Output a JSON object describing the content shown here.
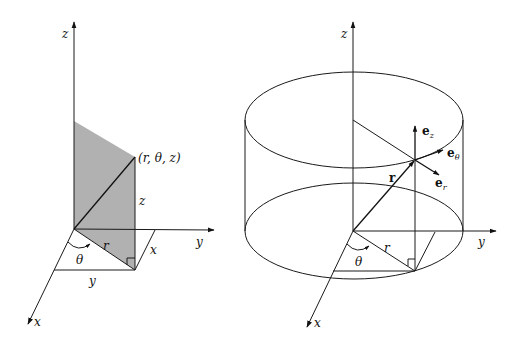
{
  "figure": {
    "left_panel": {
      "title": "Cylindrical coordinates of a point",
      "axes": {
        "z_label": "z",
        "y_label": "y",
        "x_label": "x"
      },
      "point_label": "(r, θ, z)",
      "segment_labels": {
        "height": "z",
        "radius": "r",
        "angle": "θ",
        "x_leg": "x",
        "y_leg": "y"
      },
      "shade_color": "#a9a9a9"
    },
    "right_panel": {
      "title": "Cylindrical unit vectors on a cylinder",
      "axes": {
        "z_label": "z",
        "y_label": "y",
        "x_label": "x"
      },
      "position_vector_label": "r",
      "radius_label": "r",
      "angle_label": "θ",
      "unit_vectors": [
        {
          "base": "e",
          "subscript": "z"
        },
        {
          "base": "e",
          "subscript": "θ"
        },
        {
          "base": "e",
          "subscript": "r"
        }
      ]
    }
  }
}
